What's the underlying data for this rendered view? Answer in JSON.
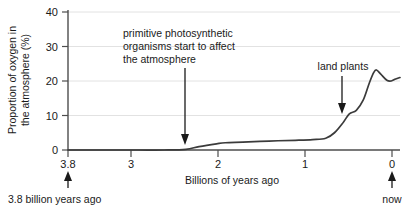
{
  "chart_data": {
    "type": "line",
    "title": "",
    "xlabel": "Billions of years ago",
    "ylabel": "Proportion of oxygen in the atmosphere (%)",
    "ylabel_line1": "Proportion of oxygen in",
    "ylabel_line2": "the atmosphere (%)",
    "xlim": [
      3.8,
      0
    ],
    "ylim": [
      0,
      40
    ],
    "x_reversed": true,
    "grid": true,
    "legend": "none",
    "xticks": [
      3.8,
      3,
      2,
      1,
      0
    ],
    "xtick_labels": [
      "3.8",
      "3",
      "2",
      "1",
      "0"
    ],
    "yticks": [
      0,
      10,
      20,
      30,
      40
    ],
    "ytick_labels": [
      "0",
      "10",
      "20",
      "30",
      "40"
    ],
    "series": [
      {
        "name": "Atmospheric oxygen",
        "x": [
          3.8,
          3.4,
          3.0,
          2.7,
          2.45,
          2.3,
          2.1,
          2.0,
          1.8,
          1.5,
          1.2,
          1.0,
          0.85,
          0.75,
          0.65,
          0.58,
          0.5,
          0.42,
          0.35,
          0.3,
          0.27,
          0.22,
          0.15,
          0.1,
          0.05,
          0.0
        ],
        "values": [
          0,
          0,
          0,
          0,
          0.2,
          1.0,
          1.8,
          2.1,
          2.3,
          2.6,
          2.8,
          3.0,
          3.4,
          5.0,
          8.0,
          10.5,
          11.5,
          14.5,
          19.5,
          22.5,
          23.2,
          22.0,
          20.2,
          20.0,
          20.6,
          21.0
        ]
      }
    ],
    "annotations": [
      {
        "id": "primitive-photosynthesis",
        "lines": [
          "primitive photosynthetic",
          "organisms start to affect",
          "the atmosphere"
        ],
        "arrow_points_to_x": 2.4,
        "arrow_points_to_y": 0
      },
      {
        "id": "land-plants",
        "lines": [
          "land plants"
        ],
        "arrow_points_to_x": 0.55,
        "arrow_points_to_y": 11
      }
    ],
    "axis_end_captions": [
      {
        "id": "start",
        "label": "3.8 billion years ago",
        "at_x": 3.8
      },
      {
        "id": "end",
        "label": "now",
        "at_x": 0
      }
    ],
    "colors": {
      "curve": "#3b3b3b",
      "axis": "#4d4d4d",
      "grid": "#e2e2e2",
      "text": "#1a1a1a",
      "background": "#ffffff"
    }
  }
}
